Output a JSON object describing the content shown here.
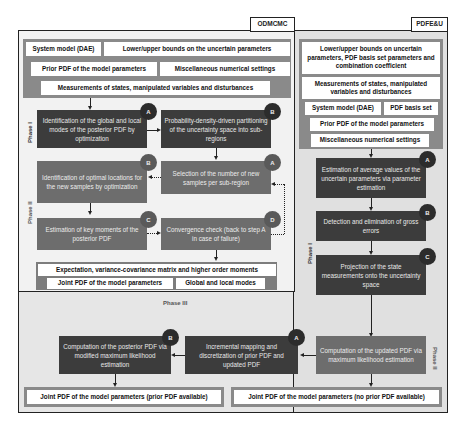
{
  "tags": {
    "odmcmc": "ODMCMC",
    "pdfeu": "PDFE&U"
  },
  "odmcmc": {
    "inputs": {
      "system_model": "System model (DAE)",
      "bounds": "Lower/upper bounds on the uncertain parameters",
      "prior_pdf": "Prior PDF of the model parameters",
      "misc": "Miscellaneous numerical settings",
      "measurements": "Measurements of states, manipulated variables and disturbances"
    },
    "phase1_label": "Phase I",
    "phase2_label": "Phase II",
    "steps": {
      "a": {
        "badge": "A",
        "text": "Identification of the global and local modes of the posterior PDF by optimization"
      },
      "b1": {
        "badge": "B",
        "text": "Probability-density-driven partitioning of the uncertainty space into sub-regions"
      },
      "b2": {
        "badge": "B",
        "text": "Identification of optimal locations for the new samples by optimization"
      },
      "a2": {
        "badge": "A",
        "text": "Selection of the number of new samples per sub-region"
      },
      "c": {
        "badge": "C",
        "text": "Estimation of key moments of the posterior PDF"
      },
      "d": {
        "badge": "D",
        "text": "Convergence check (back to step A in case of failure)"
      }
    },
    "outputs": {
      "moments": "Expectation, variance-covariance matrix and higher order moments",
      "joint_pdf": "Joint PDF of the model parameters",
      "modes": "Global and local modes"
    }
  },
  "pdfeu": {
    "inputs": {
      "bounds": "Lower/upper bounds on uncertain parameters, PDF basis set parameters and combination coefficient",
      "measurements": "Measurements of states, manipulated variables and disturbances",
      "system_model": "System model (DAE)",
      "basis_set": "PDF basis set",
      "prior_pdf": "Prior PDF of the model parameters",
      "misc": "Miscellaneous numerical settings"
    },
    "phase1_label": "Phase I",
    "phase2_label": "Phase II",
    "steps": {
      "a": {
        "badge": "A",
        "text": "Estimation of average values of the uncertain parameters via parameter estimation"
      },
      "b": {
        "badge": "B",
        "text": "Detection and elimination of gross errors"
      },
      "c": {
        "badge": "C",
        "text": "Projection of the state measurements onto the uncertainty space"
      },
      "update": {
        "text": "Computation of the updated PDF via maximum likelihood estimation"
      }
    },
    "output": "Joint PDF of the model parameters (no prior PDF available)"
  },
  "phase3": {
    "label": "Phase III",
    "steps": {
      "a": {
        "badge": "A",
        "text": "Incremental mapping and discretization of prior PDF and updated PDF"
      },
      "b": {
        "badge": "B",
        "text": "Computation of the posterior PDF via modified maximum likelihood estimation"
      }
    },
    "output": "Joint PDF of the model parameters (prior PDF available)"
  },
  "colors": {
    "dark_box": "#3c3c3c",
    "mid_box": "#6d6d6d",
    "input_band": "#8a8a8a",
    "frame_bg": "#e6e6e6",
    "inner_bg": "#f2f2f2",
    "border": "#222222"
  }
}
